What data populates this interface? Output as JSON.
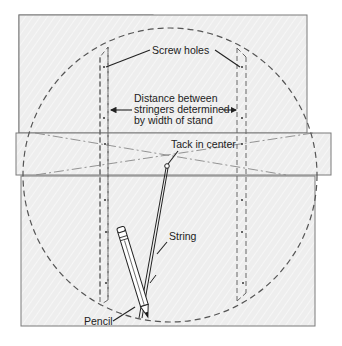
{
  "diagram": {
    "labels": {
      "screw_holes": "Screw holes",
      "distance_line1": "Distance between",
      "distance_line2": "stringers determined",
      "distance_line3": "by width of stand",
      "tack": "Tack in center",
      "string": "String",
      "pencil": "Pencil"
    },
    "colors": {
      "board_fill": "#efefef",
      "board_stroke": "#7a7a7a",
      "dashed_line": "#555555",
      "label_text": "#222222"
    }
  }
}
